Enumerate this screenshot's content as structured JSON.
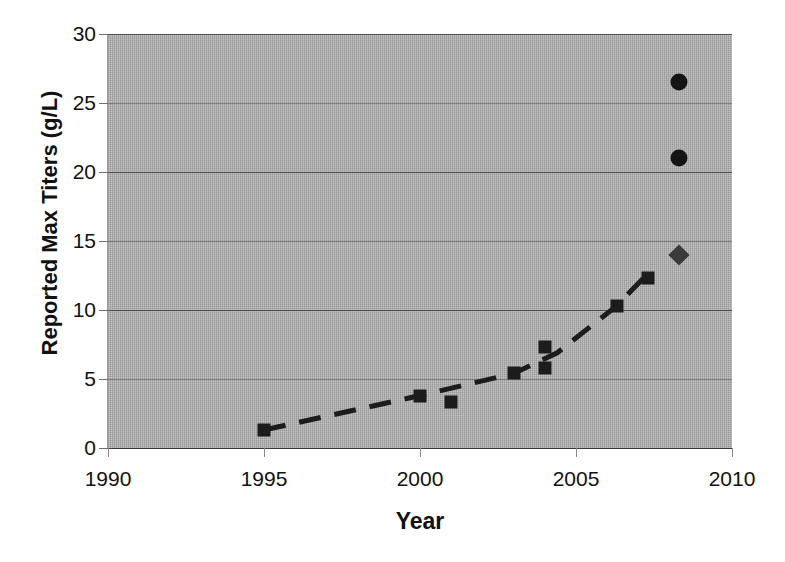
{
  "chart_data": {
    "type": "scatter",
    "title": "",
    "xlabel": "Year",
    "ylabel": "Reported Max Titers (g/L)",
    "xlim": [
      1990,
      2010
    ],
    "ylim": [
      0,
      30
    ],
    "xticks": [
      1990,
      1995,
      2000,
      2005,
      2010
    ],
    "yticks": [
      0,
      5,
      10,
      15,
      20,
      25,
      30
    ],
    "grid": "horizontal",
    "legend": "none",
    "plot_background": "#a9a9a9",
    "series": [
      {
        "name": "Reported max titers (square markers)",
        "marker": "square",
        "color": "#1c1c1c",
        "points": [
          {
            "x": 1995.0,
            "y": 1.3
          },
          {
            "x": 2000.0,
            "y": 3.8
          },
          {
            "x": 2001.0,
            "y": 3.3
          },
          {
            "x": 2003.0,
            "y": 5.4
          },
          {
            "x": 2004.0,
            "y": 7.3
          },
          {
            "x": 2004.0,
            "y": 5.8
          },
          {
            "x": 2006.3,
            "y": 10.3
          },
          {
            "x": 2007.3,
            "y": 12.3
          }
        ]
      },
      {
        "name": "High titers (circle markers)",
        "marker": "circle",
        "color": "#141414",
        "points": [
          {
            "x": 2008.3,
            "y": 26.5
          },
          {
            "x": 2008.3,
            "y": 21.0
          }
        ]
      },
      {
        "name": "Diamond marker",
        "marker": "diamond",
        "color": "#3a3a3a",
        "points": [
          {
            "x": 2008.3,
            "y": 14.0
          }
        ]
      }
    ],
    "trendline": {
      "style": "dashed",
      "color": "#1c1c1c",
      "width": 5,
      "points": [
        {
          "x": 1995.0,
          "y": 1.3
        },
        {
          "x": 2000.0,
          "y": 3.8
        },
        {
          "x": 2003.0,
          "y": 5.4
        },
        {
          "x": 2004.4,
          "y": 6.9
        },
        {
          "x": 2006.3,
          "y": 10.3
        },
        {
          "x": 2007.2,
          "y": 12.4
        }
      ]
    }
  },
  "axis": {
    "ylabel": "Reported Max Titers (g/L)",
    "xlabel": "Year",
    "ytick_labels": [
      "30",
      "25",
      "20",
      "15",
      "10",
      "5",
      "0"
    ],
    "xtick_labels": [
      "1990",
      "1995",
      "2000",
      "2005",
      "2010"
    ]
  }
}
